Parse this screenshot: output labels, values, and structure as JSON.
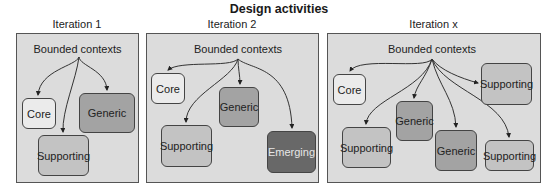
{
  "title": "Design activities",
  "colors": {
    "panel_bg": "#dcdcdc",
    "core": "#ebebeb",
    "supporting": "#c3c3c3",
    "generic": "#a3a3a3",
    "emerging": "#686868"
  },
  "panels": [
    {
      "label": "Iteration 1",
      "root": "Bounded contexts",
      "contexts": [
        {
          "label": "Core",
          "type": "core"
        },
        {
          "label": "Generic",
          "type": "generic"
        },
        {
          "label": "Supporting",
          "type": "supporting"
        }
      ]
    },
    {
      "label": "Iteration 2",
      "root": "Bounded contexts",
      "contexts": [
        {
          "label": "Core",
          "type": "core"
        },
        {
          "label": "Generic",
          "type": "generic"
        },
        {
          "label": "Supporting",
          "type": "supporting"
        },
        {
          "label": "Emerging",
          "type": "emerging"
        }
      ]
    },
    {
      "label": "Iteration x",
      "root": "Bounded contexts",
      "contexts": [
        {
          "label": "Core",
          "type": "core"
        },
        {
          "label": "Supporting",
          "type": "supporting"
        },
        {
          "label": "Generic",
          "type": "generic"
        },
        {
          "label": "Supporting",
          "type": "supporting"
        },
        {
          "label": "Generic",
          "type": "generic"
        },
        {
          "label": "Supporting",
          "type": "supporting"
        }
      ]
    }
  ]
}
